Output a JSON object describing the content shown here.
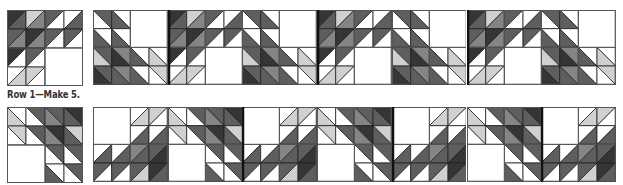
{
  "caption": "Row 1—Make 5.",
  "colors": {
    "D": "#353535",
    "M": "#5e5e5e",
    "G": "#858585",
    "L": "#d0d0d0",
    "W": "#ffffff",
    "line": "#222222",
    "grid": "#555555"
  },
  "blocks": {
    "A": {
      "diag": "back",
      "cells": [
        [
          [
            "M",
            "W"
          ],
          [
            "W",
            "M"
          ],
          null,
          null
        ],
        [
          [
            "W",
            "M"
          ],
          [
            "W",
            "M"
          ],
          null,
          null
        ],
        [
          [
            "M",
            "L"
          ],
          [
            "G",
            "D"
          ],
          [
            "W",
            "M"
          ],
          [
            "W",
            "L"
          ]
        ],
        [
          [
            "M",
            "D"
          ],
          [
            "G",
            "M"
          ],
          [
            "W",
            "M"
          ],
          [
            "L",
            "W"
          ]
        ]
      ],
      "merged": [
        {
          "r": 0,
          "c": 2,
          "rs": 2,
          "cs": 2
        }
      ]
    },
    "B": {
      "diag": "fwd",
      "cells": [
        [
          [
            "D",
            "M"
          ],
          [
            "L",
            "G"
          ],
          [
            "M",
            "W"
          ],
          [
            "W",
            "M"
          ]
        ],
        [
          [
            "M",
            "G"
          ],
          [
            "D",
            "G"
          ],
          [
            "M",
            "W"
          ],
          [
            "M",
            "W"
          ]
        ],
        [
          [
            "D",
            "W"
          ],
          [
            "M",
            "W"
          ],
          null,
          null
        ],
        [
          [
            "W",
            "L"
          ],
          [
            "L",
            "W"
          ],
          null,
          null
        ]
      ],
      "merged": [
        {
          "r": 2,
          "c": 2,
          "rs": 2,
          "cs": 2
        }
      ]
    },
    "C": {
      "diag": "back",
      "cells": [
        [
          [
            "W",
            "L"
          ],
          [
            "M",
            "W"
          ],
          [
            "M",
            "G"
          ],
          [
            "D",
            "M"
          ]
        ],
        [
          [
            "L",
            "W"
          ],
          [
            "M",
            "W"
          ],
          [
            "D",
            "G"
          ],
          [
            "L",
            "M"
          ]
        ],
        [
          null,
          null,
          [
            "M",
            "W"
          ],
          [
            "M",
            "W"
          ]
        ],
        [
          null,
          null,
          [
            "W",
            "M"
          ],
          [
            "M",
            "W"
          ]
        ]
      ],
      "merged": [
        {
          "r": 2,
          "c": 0,
          "rs": 2,
          "cs": 2
        }
      ]
    },
    "D": {
      "diag": "fwd",
      "cells": [
        [
          null,
          null,
          [
            "W",
            "L"
          ],
          [
            "L",
            "W"
          ]
        ],
        [
          null,
          null,
          [
            "W",
            "M"
          ],
          [
            "W",
            "M"
          ]
        ],
        [
          [
            "W",
            "M"
          ],
          [
            "W",
            "M"
          ],
          [
            "G",
            "M"
          ],
          [
            "M",
            "D"
          ]
        ],
        [
          [
            "M",
            "W"
          ],
          [
            "M",
            "W"
          ],
          [
            "M",
            "L"
          ],
          [
            "D",
            "M"
          ]
        ]
      ],
      "merged": [
        {
          "r": 0,
          "c": 0,
          "rs": 2,
          "cs": 2
        }
      ]
    }
  },
  "layout": {
    "single_top": {
      "block": "B",
      "x": 7,
      "y": 10,
      "size": 76
    },
    "single_bottom": {
      "block": "C",
      "x": 7,
      "y": 107,
      "size": 76
    },
    "strip_top": {
      "x": 93,
      "y": 10,
      "block_size": 74.7,
      "sequence": [
        "A",
        "B",
        "A",
        "B",
        "A",
        "B",
        "A"
      ]
    },
    "strip_bottom": {
      "x": 93,
      "y": 107,
      "block_size": 74.7,
      "sequence": [
        "D",
        "C",
        "D",
        "C",
        "D",
        "C",
        "D"
      ]
    }
  }
}
